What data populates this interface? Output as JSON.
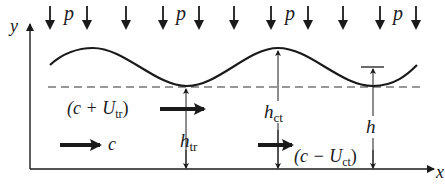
{
  "diagram": {
    "type": "wave-over-bed-schematic",
    "colors": {
      "ink": "#1a1a1a",
      "dashed_line": "#333333",
      "background": "#ffffff"
    },
    "axes": {
      "x_label": "x",
      "y_label": "y"
    },
    "pressure": {
      "symbol": "p",
      "label_count": 4,
      "arrow_count": 11
    },
    "labels": {
      "p1": "p",
      "p2": "p",
      "p3": "p",
      "p4": "p",
      "trough_velocity": {
        "open": "(c + U",
        "sub": "tr",
        "close": ")"
      },
      "crest_velocity": {
        "open": "(c − U",
        "sub": "ct",
        "close": ")"
      },
      "wave_speed": "c",
      "h_trough": {
        "base": "h",
        "sub": "tr"
      },
      "h_crest": {
        "base": "h",
        "sub": "ct"
      },
      "h_local": "h"
    },
    "elements": [
      "y-axis",
      "x-axis",
      "wave-surface",
      "mean-water-level-dashed",
      "pressure-arrows",
      "trough-depth-marker",
      "crest-depth-marker",
      "local-depth-marker",
      "velocity-arrows"
    ]
  }
}
